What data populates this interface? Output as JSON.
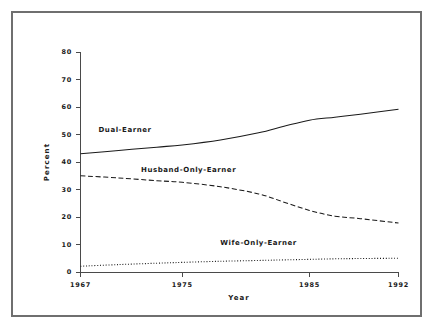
{
  "figure": {
    "border_color": "#6f6f6f",
    "background": "#ffffff"
  },
  "chart_data": {
    "type": "line",
    "title": "",
    "xlabel": "Year",
    "ylabel": "Percent",
    "xlim": [
      1967,
      1992
    ],
    "ylim": [
      0,
      80
    ],
    "grid": false,
    "legend_position": "inline-annotations",
    "xticks": [
      1967,
      1975,
      1985,
      1992
    ],
    "xtick_labels": [
      "1967",
      "1975",
      "1985",
      "1992"
    ],
    "yticks": [
      0,
      10,
      20,
      30,
      40,
      50,
      60,
      70,
      80
    ],
    "ytick_labels": [
      "0",
      "10",
      "20",
      "30",
      "40",
      "50",
      "60",
      "70",
      "80"
    ],
    "x": [
      1967,
      1970,
      1973,
      1975,
      1978,
      1981,
      1983,
      1985,
      1987,
      1989,
      1992
    ],
    "series": [
      {
        "name": "Dual-Earner",
        "style": "solid",
        "color": "#1a1a1a",
        "values": [
          43.0,
          44.2,
          45.4,
          46.2,
          48.0,
          50.6,
          53.0,
          55.2,
          56.3,
          57.4,
          59.2
        ],
        "label_x": 1970.5,
        "label_y": 51.0
      },
      {
        "name": "Husband-Only-Earner",
        "style": "dashed",
        "color": "#1a1a1a",
        "values": [
          35.0,
          34.2,
          33.2,
          32.6,
          31.0,
          28.4,
          25.4,
          22.4,
          20.3,
          19.4,
          17.8
        ],
        "label_x": 1975.5,
        "label_y": 36.5
      },
      {
        "name": "Wife-Only-Earner",
        "style": "dotted",
        "color": "#1a1a1a",
        "values": [
          2.1,
          2.7,
          3.2,
          3.5,
          3.9,
          4.2,
          4.4,
          4.6,
          4.8,
          4.9,
          5.0
        ],
        "label_x": 1981.0,
        "label_y": 10.0
      }
    ]
  }
}
